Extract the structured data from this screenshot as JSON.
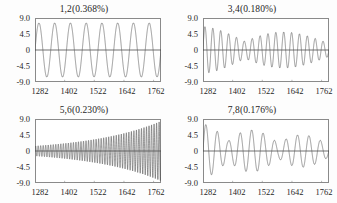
{
  "figure": {
    "background_color": "#fdfdfd",
    "frame_color": "#8a8a8a",
    "curve_color": "#555555",
    "zero_line_color": "#333333",
    "text_color": "#1f1f1f"
  },
  "chart_data": [
    {
      "type": "line",
      "title": "1,2(0.368%)",
      "panel_id": "1,2",
      "damping_percent": "0.368%",
      "xlabel": "",
      "ylabel": "",
      "xlim": [
        1282,
        1792
      ],
      "ylim": [
        -9.0,
        9.0
      ],
      "xticks": [
        1282,
        1402,
        1522,
        1642,
        1762
      ],
      "xtick_labels": [
        "1282",
        "1402",
        "1522",
        "1642",
        "1762"
      ],
      "yticks": [
        9.0,
        4.5,
        0,
        -4.5,
        -9.0
      ],
      "ytick_labels": [
        "9.0",
        "4.5",
        "0",
        "-4.5",
        "-9.0"
      ],
      "grid": false,
      "legend": null,
      "waveform": {
        "shape": "steady-sinusoid",
        "cycles": 8,
        "amplitude_start": 7.6,
        "amplitude_end": 7.6,
        "beat_cycles": 0,
        "phase": 0
      }
    },
    {
      "type": "line",
      "title": "3,4(0.180%)",
      "panel_id": "3,4",
      "damping_percent": "0.180%",
      "xlabel": "",
      "ylabel": "",
      "xlim": [
        1282,
        1792
      ],
      "ylim": [
        -9.0,
        9.0
      ],
      "xticks": [
        1282,
        1402,
        1522,
        1642,
        1762
      ],
      "xtick_labels": [
        "1282",
        "1402",
        "1522",
        "1642",
        "1762"
      ],
      "yticks": [
        9.0,
        4.5,
        0,
        -4.5,
        -9.0
      ],
      "ytick_labels": [
        "9.0",
        "4.5",
        "0",
        "-4.5",
        "-9.0"
      ],
      "grid": false,
      "legend": null,
      "waveform": {
        "shape": "decaying-sinusoid",
        "cycles": 16,
        "amplitude_start": 6.6,
        "amplitude_end": 4.4,
        "beat_cycles": 1.5,
        "phase": 0
      }
    },
    {
      "type": "line",
      "title": "5,6(0.230%)",
      "panel_id": "5,6",
      "damping_percent": "0.230%",
      "xlabel": "",
      "ylabel": "",
      "xlim": [
        1282,
        1792
      ],
      "ylim": [
        -9.0,
        9.0
      ],
      "xticks": [
        1282,
        1402,
        1522,
        1642,
        1762
      ],
      "xtick_labels": [
        "1282",
        "1402",
        "1522",
        "1642",
        "1762"
      ],
      "yticks": [
        9.0,
        4.5,
        0,
        -4.5,
        -9.0
      ],
      "ytick_labels": [
        "9.0",
        "4.5",
        "0",
        "-4.5",
        "-9.0"
      ],
      "grid": false,
      "legend": null,
      "waveform": {
        "shape": "growing-sinusoid",
        "cycles": 50,
        "amplitude_start": 1.4,
        "amplitude_end": 8.4,
        "beat_cycles": 0,
        "phase": 0
      }
    },
    {
      "type": "line",
      "title": "7,8(0.176%)",
      "panel_id": "7,8",
      "damping_percent": "0.176%",
      "xlabel": "",
      "ylabel": "",
      "xlim": [
        1282,
        1792
      ],
      "ylim": [
        -9.0,
        9.0
      ],
      "xticks": [
        1282,
        1402,
        1522,
        1642,
        1762
      ],
      "xtick_labels": [
        "1282",
        "1402",
        "1522",
        "1642",
        "1762"
      ],
      "yticks": [
        9.0,
        4.5,
        0,
        -4.5,
        -9.0
      ],
      "ytick_labels": [
        "9.0",
        "4.5",
        "0",
        "-4.5",
        "-9.0"
      ],
      "grid": false,
      "legend": null,
      "waveform": {
        "shape": "beating-decaying-sinusoid",
        "cycles": 11,
        "amplitude_start": 7.6,
        "amplitude_end": 4.0,
        "beat_cycles": 2.5,
        "phase": 0
      }
    }
  ]
}
